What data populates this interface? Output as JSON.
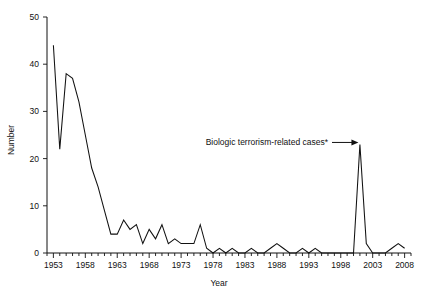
{
  "chart_data": {
    "type": "line",
    "title": "",
    "xlabel": "Year",
    "ylabel": "Number",
    "xlim": [
      1952,
      2009
    ],
    "ylim": [
      0,
      50
    ],
    "yticks": [
      0,
      10,
      20,
      30,
      40,
      50
    ],
    "ytick_labels": [
      "0",
      "10",
      "20",
      "30",
      "40",
      "50"
    ],
    "xticks": [
      1953,
      1958,
      1963,
      1968,
      1973,
      1978,
      1983,
      1988,
      1993,
      1998,
      2003,
      2008
    ],
    "xtick_labels": [
      "1953",
      "1958",
      "1963",
      "1968",
      "1973",
      "1978",
      "1983",
      "1988",
      "1993",
      "1998",
      "2003",
      "2008"
    ],
    "minor_xticks_every": 1,
    "grid": false,
    "legend": "none",
    "series": [
      {
        "name": "Number of cases",
        "color": "#111111",
        "x": [
          1953,
          1954,
          1955,
          1956,
          1957,
          1958,
          1959,
          1960,
          1961,
          1962,
          1963,
          1964,
          1965,
          1966,
          1967,
          1968,
          1969,
          1970,
          1971,
          1972,
          1973,
          1974,
          1975,
          1976,
          1977,
          1978,
          1979,
          1980,
          1981,
          1982,
          1983,
          1984,
          1985,
          1986,
          1987,
          1988,
          1989,
          1990,
          1991,
          1992,
          1993,
          1994,
          1995,
          1996,
          1997,
          1998,
          1999,
          2000,
          2001,
          2002,
          2003,
          2004,
          2005,
          2006,
          2007,
          2008
        ],
        "values": [
          44,
          22,
          38,
          37,
          32,
          25,
          18,
          14,
          9,
          4,
          4,
          7,
          5,
          6,
          2,
          5,
          3,
          6,
          2,
          3,
          2,
          2,
          2,
          6,
          1,
          0,
          1,
          0,
          1,
          0,
          0,
          1,
          0,
          0,
          1,
          2,
          1,
          0,
          0,
          1,
          0,
          1,
          0,
          0,
          0,
          0,
          0,
          0,
          23,
          2,
          0,
          0,
          0,
          1,
          2,
          1
        ]
      }
    ],
    "annotations": [
      {
        "text": "Biologic terrorism-related cases*",
        "points_to_year": 2001,
        "points_to_value": 23,
        "arrow": "right"
      }
    ]
  },
  "axes": {
    "y_label": "Number",
    "x_label": "Year"
  }
}
